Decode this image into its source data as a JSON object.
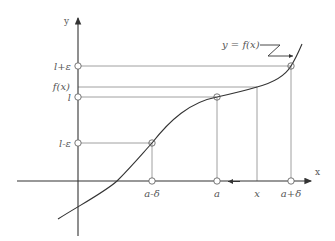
{
  "diagram": {
    "curve_label": "y = f(x)",
    "axes": {
      "x_label": "x",
      "y_label": "y"
    },
    "y_ticks": [
      {
        "label": "l+ε",
        "y": 66,
        "marker": true
      },
      {
        "label": "f(x)",
        "y": 87,
        "marker": false
      },
      {
        "label": "l",
        "y": 97,
        "marker": true
      },
      {
        "label": "l-ε",
        "y": 143,
        "marker": true
      }
    ],
    "x_ticks": [
      {
        "label": "a-δ",
        "x": 152,
        "marker": true
      },
      {
        "label": "a",
        "x": 217,
        "marker": true
      },
      {
        "label": "x",
        "x": 257,
        "marker": false
      },
      {
        "label": "a+δ",
        "x": 291,
        "marker": true
      }
    ],
    "colors": {
      "axis": "#333333",
      "curve": "#333333",
      "guide": "#888888",
      "text": "#555555"
    }
  }
}
